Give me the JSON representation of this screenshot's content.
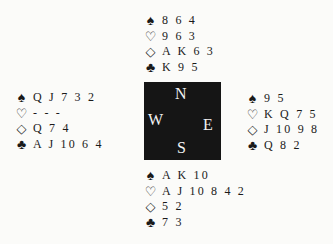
{
  "suit_symbols": {
    "spades": "♠",
    "hearts": "♡",
    "diamonds": "◇",
    "clubs": "♣"
  },
  "hands": {
    "north": {
      "spades": "8 6 4",
      "hearts": "9 6 3",
      "diamonds": "A K 6 3",
      "clubs": "K 9 5"
    },
    "west": {
      "spades": "Q J 7 3 2",
      "hearts": "- - -",
      "diamonds": "Q 7 4",
      "clubs": "A J 10 6 4"
    },
    "east": {
      "spades": "9 5",
      "hearts": "K Q 7 5",
      "diamonds": "J 10 9 8",
      "clubs": "Q 8 2"
    },
    "south": {
      "spades": "A K 10",
      "hearts": "A J 10 8 4 2",
      "diamonds": "5 2",
      "clubs": "7 3"
    }
  },
  "compass": {
    "north": "N",
    "west": "W",
    "east": "E",
    "south": "S"
  },
  "colors": {
    "compass_bg": "#151515",
    "compass_text": "#f2f2f2",
    "page_bg": "#fbfbf9"
  }
}
